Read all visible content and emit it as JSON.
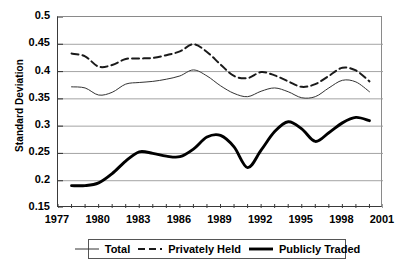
{
  "chart_data": {
    "type": "line",
    "title": "",
    "xlabel": "",
    "ylabel": "Standard Deviation",
    "xlim": [
      1977,
      2001
    ],
    "ylim": [
      0.15,
      0.5
    ],
    "y_ticks": [
      "0.15",
      "0.2",
      "0.25",
      "0.3",
      "0.35",
      "0.4",
      "0.45",
      "0.5"
    ],
    "y_tick_values": [
      0.15,
      0.2,
      0.25,
      0.3,
      0.35,
      0.4,
      0.45,
      0.5
    ],
    "x_ticks": [
      "1977",
      "1980",
      "1983",
      "1986",
      "1989",
      "1992",
      "1995",
      "1998",
      "2001"
    ],
    "x_tick_values": [
      1977,
      1980,
      1983,
      1986,
      1989,
      1992,
      1995,
      1998,
      2001
    ],
    "x_minor_tick_interval": 1,
    "grid": "horizontal",
    "legend_position": "bottom",
    "x": [
      1978,
      1979,
      1980,
      1981,
      1982,
      1983,
      1984,
      1985,
      1986,
      1987,
      1988,
      1989,
      1990,
      1991,
      1992,
      1993,
      1994,
      1995,
      1996,
      1997,
      1998,
      1999,
      2000
    ],
    "series": [
      {
        "name": "Total",
        "style": "thin-solid",
        "color": "#333333",
        "values": [
          0.372,
          0.37,
          0.357,
          0.362,
          0.377,
          0.38,
          0.382,
          0.386,
          0.392,
          0.403,
          0.392,
          0.374,
          0.36,
          0.354,
          0.364,
          0.37,
          0.363,
          0.352,
          0.354,
          0.37,
          0.384,
          0.381,
          0.363
        ]
      },
      {
        "name": "Privately Held",
        "style": "dashed",
        "color": "#1a1a1a",
        "values": [
          0.433,
          0.428,
          0.409,
          0.412,
          0.423,
          0.424,
          0.425,
          0.43,
          0.437,
          0.45,
          0.436,
          0.413,
          0.392,
          0.388,
          0.399,
          0.393,
          0.382,
          0.372,
          0.377,
          0.392,
          0.407,
          0.402,
          0.382
        ]
      },
      {
        "name": "Publicly Traded",
        "style": "thick-solid",
        "color": "#000000",
        "values": [
          0.191,
          0.191,
          0.196,
          0.213,
          0.236,
          0.253,
          0.25,
          0.245,
          0.244,
          0.258,
          0.28,
          0.283,
          0.262,
          0.224,
          0.256,
          0.29,
          0.308,
          0.295,
          0.272,
          0.288,
          0.306,
          0.316,
          0.31
        ]
      }
    ]
  },
  "legend": {
    "entries": [
      {
        "label": "Total"
      },
      {
        "label": "Privately Held"
      },
      {
        "label": "Publicly Traded"
      }
    ]
  }
}
